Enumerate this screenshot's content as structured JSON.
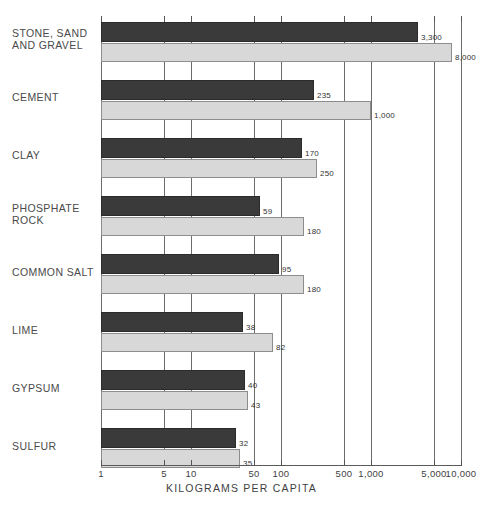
{
  "chart_data": {
    "type": "bar",
    "orientation": "horizontal",
    "title": "",
    "xlabel": "KILOGRAMS PER CAPITA",
    "ylabel": "",
    "scale": "log",
    "xlim": [
      1,
      10000
    ],
    "grid": true,
    "legend": "none",
    "tick_labels": [
      "1",
      "5",
      "10",
      "50",
      "100",
      "500",
      "1,000",
      "5,000",
      "10,000"
    ],
    "tick_values": [
      1,
      5,
      10,
      50,
      100,
      500,
      1000,
      5000,
      10000
    ],
    "categories": [
      "STONE, SAND\nAND GRAVEL",
      "CEMENT",
      "CLAY",
      "PHOSPHATE\nROCK",
      "COMMON SALT",
      "LIME",
      "GYPSUM",
      "SULFUR"
    ],
    "series": [
      {
        "name": "dark",
        "color": "#3a3a3a",
        "values": [
          3300,
          235,
          170,
          59,
          95,
          38,
          40,
          32
        ],
        "labels": [
          "3,300",
          "235",
          "170",
          "59",
          "95",
          "38",
          "40",
          "32"
        ]
      },
      {
        "name": "light",
        "color": "#d8d8d8",
        "values": [
          8000,
          1000,
          250,
          180,
          180,
          82,
          43,
          35
        ],
        "labels": [
          "8,000",
          "1,000",
          "250",
          "180",
          "180",
          "82",
          "43",
          "35"
        ]
      }
    ]
  },
  "colors": {
    "dark_bar": "#3a3a3a",
    "light_bar": "#d8d8d8",
    "axis": "#5a5a5a",
    "grid": "#6d6d6d",
    "text": "#3f3f3f",
    "background": "#ffffff"
  }
}
